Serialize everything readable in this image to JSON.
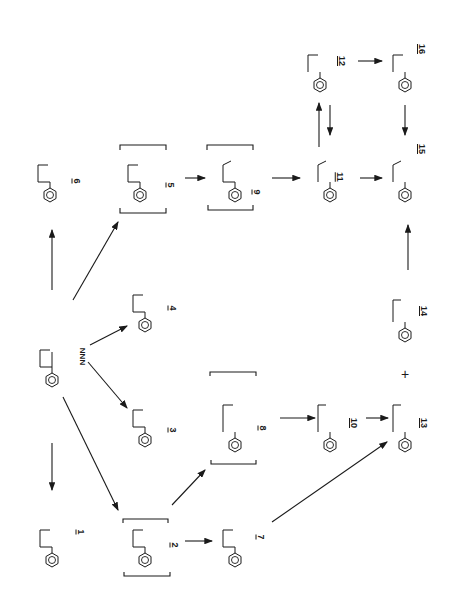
{
  "diagram": {
    "orientation": "rotated 90 degrees clockwise",
    "parent": {
      "id": "NNN",
      "label": "NNN",
      "ring_positions": [
        "2'",
        "3'",
        "4'",
        "5'"
      ],
      "group": "N=O"
    },
    "compounds": [
      {
        "id": "1",
        "label": "1",
        "desc": "NNN-1-N-oxide",
        "groups": [
          "N=O",
          "N+-O-"
        ]
      },
      {
        "id": "2",
        "label": "2",
        "desc": "2'-hydroxy-NNN (bracketed intermediate)",
        "groups": [
          "OH",
          "N=O"
        ],
        "bracketed": true
      },
      {
        "id": "3",
        "label": "3",
        "desc": "3'-hydroxy-NNN",
        "groups": [
          "HO",
          "N=O"
        ]
      },
      {
        "id": "4",
        "label": "4",
        "desc": "4'-hydroxy-NNN",
        "groups": [
          "OH",
          "N=O"
        ]
      },
      {
        "id": "5",
        "label": "5",
        "desc": "5'-hydroxy-NNN (bracketed intermediate)",
        "groups": [
          "OH",
          "N=O"
        ],
        "bracketed": true
      },
      {
        "id": "6",
        "label": "6",
        "desc": "norcotinine",
        "groups": [
          "=O",
          "N-H"
        ]
      },
      {
        "id": "7",
        "label": "7",
        "desc": "myosmine",
        "groups": [
          "N"
        ]
      },
      {
        "id": "8",
        "label": "8",
        "desc": "keto diazohydroxide (bracketed)",
        "groups": [
          "=O",
          "N=N-OH"
        ],
        "bracketed": true
      },
      {
        "id": "9",
        "label": "9",
        "desc": "aldehyde diazohydroxide (bracketed)",
        "groups": [
          "CHO",
          "N=N-OH"
        ],
        "bracketed": true
      },
      {
        "id": "10",
        "label": "10",
        "desc": "keto alcohol",
        "groups": [
          "=O",
          "OH"
        ]
      },
      {
        "id": "11",
        "label": "11",
        "desc": "hydroxy aldehyde",
        "groups": [
          "OH",
          "=O"
        ]
      },
      {
        "id": "12",
        "label": "12",
        "desc": "lactol",
        "groups": [
          "O",
          "OH"
        ]
      },
      {
        "id": "13",
        "label": "13",
        "desc": "keto acid",
        "groups": [
          "=O",
          "OH",
          "=O"
        ]
      },
      {
        "id": "14",
        "label": "14",
        "desc": "diol",
        "groups": [
          "OH",
          "OH"
        ]
      },
      {
        "id": "15",
        "label": "15",
        "desc": "hydroxy acid",
        "groups": [
          "OH",
          "=O",
          "OH"
        ]
      },
      {
        "id": "16",
        "label": "16",
        "desc": "lactone",
        "groups": [
          "O",
          "=O"
        ]
      }
    ],
    "edges": [
      {
        "from": "NNN",
        "to": "1"
      },
      {
        "from": "NNN",
        "to": "2"
      },
      {
        "from": "NNN",
        "to": "3"
      },
      {
        "from": "NNN",
        "to": "4"
      },
      {
        "from": "NNN",
        "to": "5"
      },
      {
        "from": "NNN",
        "to": "6"
      },
      {
        "from": "2",
        "to": "7"
      },
      {
        "from": "2",
        "to": "8"
      },
      {
        "from": "5",
        "to": "9"
      },
      {
        "from": "8",
        "to": "10"
      },
      {
        "from": "9",
        "to": "11"
      },
      {
        "from": "10",
        "to": "13"
      },
      {
        "from": "7",
        "to": "13"
      },
      {
        "from": "11",
        "to": "12"
      },
      {
        "from": "12",
        "to": "11"
      },
      {
        "from": "11",
        "to": "15"
      },
      {
        "from": "12",
        "to": "16"
      },
      {
        "from": "16",
        "to": "15"
      },
      {
        "from": "14",
        "to": "15"
      }
    ],
    "plus_sign": "+",
    "labels": {
      "nnn": "NNN",
      "c1": "1",
      "c2": "2",
      "c3": "3",
      "c4": "4",
      "c5": "5",
      "c6": "6",
      "c7": "7",
      "c8": "8",
      "c9": "9",
      "c10": "10",
      "c11": "11",
      "c12": "12",
      "c13": "13",
      "c14": "14",
      "c15": "15",
      "c16": "16"
    }
  }
}
